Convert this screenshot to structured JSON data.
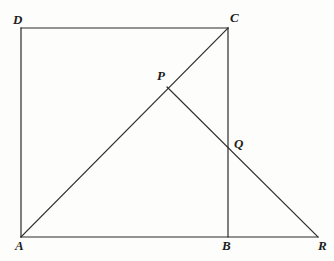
{
  "figure": {
    "background_color": "#fdfdfb",
    "stroke_color": "#2b2b2b",
    "stroke_width": 1.2,
    "width": 334,
    "height": 261,
    "points": {
      "A": {
        "label": "A",
        "x": 21,
        "y": 237
      },
      "B": {
        "label": "B",
        "x": 228,
        "y": 237
      },
      "C": {
        "label": "C",
        "x": 228,
        "y": 28
      },
      "D": {
        "label": "D",
        "x": 21,
        "y": 28
      },
      "P": {
        "label": "P",
        "x": 167,
        "y": 87
      },
      "Q": {
        "label": "Q",
        "x": 228,
        "y": 148
      },
      "R": {
        "label": "R",
        "x": 318,
        "y": 237
      }
    },
    "segments": [
      {
        "name": "AD",
        "from": "A",
        "to": "D",
        "description": "left side of square"
      },
      {
        "name": "DC",
        "from": "D",
        "to": "C",
        "description": "top side of square"
      },
      {
        "name": "CB",
        "from": "C",
        "to": "B",
        "description": "right side of square through Q"
      },
      {
        "name": "AR",
        "from": "A",
        "to": "R",
        "description": "base line through B extended to R"
      },
      {
        "name": "AC",
        "from": "A",
        "to": "C",
        "description": "diagonal of square through P"
      },
      {
        "name": "PR",
        "from": "P",
        "to": "R",
        "description": "segment from P through Q to R"
      }
    ]
  }
}
